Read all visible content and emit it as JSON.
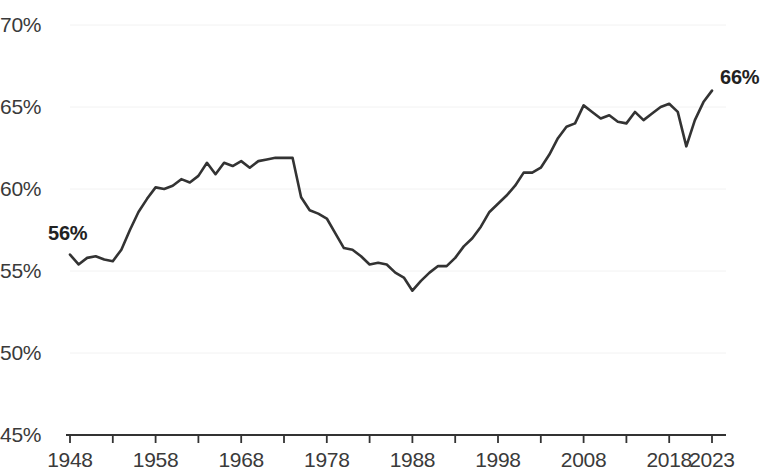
{
  "chart_data": {
    "type": "line",
    "title": "",
    "subtitle": "",
    "xlabel": "",
    "ylabel": "",
    "ylim": [
      45,
      70
    ],
    "xlim": [
      1948,
      2023
    ],
    "grid": true,
    "legend_position": "none",
    "y_ticks": [
      "45%",
      "50%",
      "55%",
      "60%",
      "65%",
      "70%"
    ],
    "y_tick_values": [
      45,
      50,
      55,
      60,
      65,
      70
    ],
    "x_ticks": [
      "1948",
      "1958",
      "1968",
      "1978",
      "1988",
      "1998",
      "2008",
      "2018",
      "2023"
    ],
    "x_tick_values": [
      1948,
      1958,
      1968,
      1978,
      1988,
      1998,
      2008,
      2018,
      2023
    ],
    "x_minor_tick_values": [
      1948,
      1953,
      1958,
      1963,
      1968,
      1973,
      1978,
      1983,
      1988,
      1993,
      1998,
      2003,
      2008,
      2013,
      2018,
      2023
    ],
    "annotations": [
      {
        "text": "56%",
        "x": 1948,
        "y": 56.0
      },
      {
        "text": "66%",
        "x": 2023,
        "y": 66.0
      }
    ],
    "series": [
      {
        "name": "Rate",
        "color": "#333333",
        "x": [
          1948,
          1949,
          1950,
          1951,
          1952,
          1953,
          1954,
          1955,
          1956,
          1957,
          1958,
          1959,
          1960,
          1961,
          1962,
          1963,
          1964,
          1965,
          1966,
          1967,
          1968,
          1969,
          1970,
          1971,
          1972,
          1973,
          1974,
          1975,
          1976,
          1977,
          1978,
          1979,
          1980,
          1981,
          1982,
          1983,
          1984,
          1985,
          1986,
          1987,
          1988,
          1989,
          1990,
          1991,
          1992,
          1993,
          1994,
          1995,
          1996,
          1997,
          1998,
          1999,
          2000,
          2001,
          2002,
          2003,
          2004,
          2005,
          2006,
          2007,
          2008,
          2009,
          2010,
          2011,
          2012,
          2013,
          2014,
          2015,
          2016,
          2017,
          2018,
          2019,
          2020,
          2021,
          2022,
          2023
        ],
        "values": [
          56.0,
          55.4,
          55.8,
          55.9,
          55.7,
          55.6,
          56.3,
          57.5,
          58.6,
          59.4,
          60.1,
          60.0,
          60.2,
          60.6,
          60.4,
          60.8,
          61.6,
          60.9,
          61.6,
          61.4,
          61.7,
          61.3,
          61.7,
          61.8,
          61.9,
          61.9,
          61.9,
          59.5,
          58.7,
          58.5,
          58.2,
          57.3,
          56.4,
          56.3,
          55.9,
          55.4,
          55.5,
          55.4,
          54.9,
          54.6,
          53.8,
          54.4,
          54.9,
          55.3,
          55.3,
          55.8,
          56.5,
          57.0,
          57.7,
          58.6,
          59.1,
          59.6,
          60.2,
          61.0,
          61.0,
          61.3,
          62.1,
          63.1,
          63.8,
          64.0,
          65.1,
          64.7,
          64.3,
          64.5,
          64.1,
          64.0,
          64.7,
          64.2,
          64.6,
          65.0,
          65.2,
          64.7,
          62.6,
          64.2,
          65.3,
          66.0
        ]
      }
    ]
  },
  "axis": {
    "y_labels": [
      {
        "text": "70%",
        "value": 70
      },
      {
        "text": "65%",
        "value": 65
      },
      {
        "text": "60%",
        "value": 60
      },
      {
        "text": "55%",
        "value": 55
      },
      {
        "text": "50%",
        "value": 50
      },
      {
        "text": "45%",
        "value": 45
      }
    ],
    "x_labels": [
      {
        "text": "1948",
        "value": 1948
      },
      {
        "text": "1958",
        "value": 1958
      },
      {
        "text": "1968",
        "value": 1968
      },
      {
        "text": "1978",
        "value": 1978
      },
      {
        "text": "1988",
        "value": 1988
      },
      {
        "text": "1998",
        "value": 1998
      },
      {
        "text": "2008",
        "value": 2008
      },
      {
        "text": "2018",
        "value": 2018
      },
      {
        "text": "2023",
        "value": 2023
      }
    ]
  },
  "colors": {
    "line": "#333333",
    "axis": "#333333",
    "grid": "#f2f2f2",
    "text": "#3a3a3a",
    "annotation": "#222222",
    "background": "#ffffff"
  }
}
